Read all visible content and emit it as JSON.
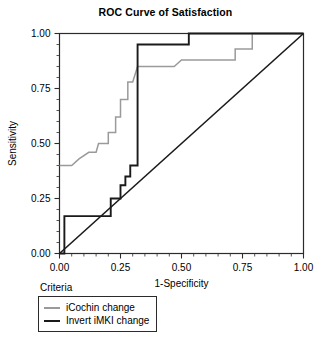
{
  "chart_data": {
    "type": "line",
    "title": "ROC Curve of Satisfaction",
    "xlabel": "1-Specificity",
    "ylabel": "Sensitivity",
    "xlim": [
      0.0,
      1.0
    ],
    "ylim": [
      0.0,
      1.0
    ],
    "xticks": [
      "0.00",
      "0.25",
      "0.50",
      "0.75",
      "1.00"
    ],
    "yticks": [
      "0.00",
      "0.25",
      "0.50",
      "0.75",
      "1.00"
    ],
    "xtick_values": [
      0.0,
      0.25,
      0.5,
      0.75,
      1.0
    ],
    "ytick_values": [
      0.0,
      0.25,
      0.5,
      0.75,
      1.0
    ],
    "grid": false,
    "legend_position": "below-plot-left",
    "legend_title": "Criteria",
    "series": [
      {
        "name": "iCochin change",
        "color": "#9a9a9a",
        "style": "step",
        "points": [
          [
            0.0,
            0.4
          ],
          [
            0.05,
            0.4
          ],
          [
            0.08,
            0.43
          ],
          [
            0.12,
            0.46
          ],
          [
            0.15,
            0.46
          ],
          [
            0.16,
            0.5
          ],
          [
            0.2,
            0.5
          ],
          [
            0.2,
            0.55
          ],
          [
            0.23,
            0.55
          ],
          [
            0.23,
            0.62
          ],
          [
            0.25,
            0.62
          ],
          [
            0.25,
            0.7
          ],
          [
            0.28,
            0.7
          ],
          [
            0.28,
            0.78
          ],
          [
            0.3,
            0.78
          ],
          [
            0.32,
            0.85
          ],
          [
            0.47,
            0.85
          ],
          [
            0.5,
            0.88
          ],
          [
            0.72,
            0.88
          ],
          [
            0.72,
            0.93
          ],
          [
            0.79,
            0.93
          ],
          [
            0.79,
            1.0
          ],
          [
            1.0,
            1.0
          ]
        ]
      },
      {
        "name": "Invert iMKI change",
        "color": "#1a1a1a",
        "style": "step",
        "points": [
          [
            0.0,
            0.0
          ],
          [
            0.02,
            0.0
          ],
          [
            0.02,
            0.17
          ],
          [
            0.21,
            0.17
          ],
          [
            0.21,
            0.25
          ],
          [
            0.25,
            0.25
          ],
          [
            0.25,
            0.31
          ],
          [
            0.27,
            0.31
          ],
          [
            0.27,
            0.35
          ],
          [
            0.29,
            0.35
          ],
          [
            0.29,
            0.4
          ],
          [
            0.32,
            0.4
          ],
          [
            0.32,
            0.95
          ],
          [
            0.53,
            0.95
          ],
          [
            0.53,
            1.0
          ],
          [
            1.0,
            1.0
          ]
        ]
      },
      {
        "name": "reference-diagonal",
        "color": "#1a1a1a",
        "style": "line",
        "points": [
          [
            0.0,
            0.0
          ],
          [
            1.0,
            1.0
          ]
        ]
      }
    ]
  },
  "legend": {
    "title": "Criteria",
    "items": [
      {
        "label": "iCochin change",
        "color": "#9a9a9a"
      },
      {
        "label": "Invert iMKI change",
        "color": "#1a1a1a"
      }
    ]
  }
}
